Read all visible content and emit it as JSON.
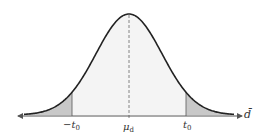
{
  "diagram": {
    "type": "normal-distribution",
    "colors": {
      "curve": "#222222",
      "tail_fill": "#c8c8c8",
      "body_fill": "#f4f4f4",
      "axis": "#555555",
      "center_line": "#777777"
    },
    "labels": {
      "left_tick": {
        "main": "−t",
        "sub": "0"
      },
      "center_tick": {
        "main": "μ",
        "sub": "d"
      },
      "right_tick": {
        "main": "t",
        "sub": "0"
      },
      "axis_label": "d̄"
    }
  }
}
